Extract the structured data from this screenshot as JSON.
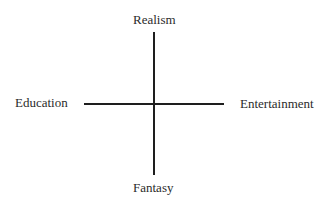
{
  "diagram": {
    "type": "quadrant-axes",
    "axes": {
      "vertical": {
        "top": "Realism",
        "bottom": "Fantasy"
      },
      "horizontal": {
        "left": "Education",
        "right": "Entertainment"
      }
    },
    "colors": {
      "line": "#1e1e1e",
      "text": "#2b2b2b",
      "background": "#ffffff"
    }
  }
}
